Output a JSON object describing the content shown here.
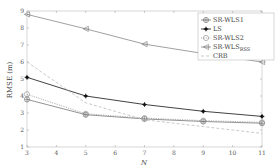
{
  "chart_data": {
    "type": "line",
    "title": "",
    "xlabel": "N",
    "ylabel": "RMSE (m)",
    "x": [
      3,
      5,
      7,
      9,
      11
    ],
    "xticks": [
      3,
      4,
      5,
      6,
      7,
      8,
      9,
      10,
      11
    ],
    "yticks": [
      1,
      2,
      3,
      4,
      5,
      6,
      7,
      8,
      9
    ],
    "xlim": [
      3,
      11
    ],
    "ylim": [
      1,
      9
    ],
    "grid": false,
    "legend_position": "upper right",
    "series": [
      {
        "name": "SR-WLS1",
        "marker": "circle-plus",
        "line": "solid",
        "color": "#777777",
        "values": [
          3.8,
          2.9,
          2.65,
          2.5,
          2.4
        ]
      },
      {
        "name": "LS",
        "marker": "star",
        "line": "solid",
        "color": "#111111",
        "values": [
          5.1,
          4.0,
          3.5,
          3.1,
          2.8
        ]
      },
      {
        "name": "SR-WLS2",
        "marker": "circle",
        "line": "dotted",
        "color": "#999999",
        "values": [
          4.1,
          2.95,
          2.7,
          2.55,
          2.45
        ]
      },
      {
        "name": "SR-WLS_RSS",
        "marker": "triangle-left",
        "line": "solid",
        "color": "#888888",
        "values": [
          8.8,
          7.95,
          7.05,
          6.5,
          6.0
        ]
      },
      {
        "name": "CRB",
        "marker": "none",
        "line": "dashed",
        "color": "#bbbbbb",
        "values": [
          6.0,
          3.6,
          2.6,
          2.2,
          1.8
        ]
      }
    ]
  },
  "legend": {
    "items": [
      {
        "label": "SR-WLS1",
        "sub": ""
      },
      {
        "label": "LS",
        "sub": ""
      },
      {
        "label": "SR-WLS2",
        "sub": ""
      },
      {
        "label": "SR-WLS",
        "sub": "RSS"
      },
      {
        "label": "CRB",
        "sub": ""
      }
    ]
  },
  "axes": {
    "xlabel": "N",
    "ylabel": "RMSE (m)",
    "xtick_labels": [
      "3",
      "4",
      "5",
      "6",
      "7",
      "8",
      "9",
      "10",
      "11"
    ],
    "ytick_labels": [
      "1",
      "2",
      "3",
      "4",
      "5",
      "6",
      "7",
      "8",
      "9"
    ]
  }
}
